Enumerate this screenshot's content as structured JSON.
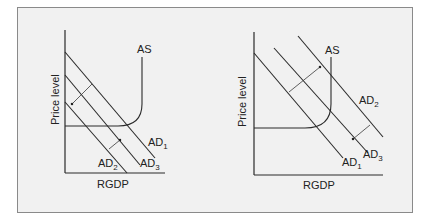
{
  "figure": {
    "panels": [
      {
        "id": "left",
        "y_label": "Price level",
        "x_label": "RGDP",
        "curves": {
          "as": "AS",
          "ad1": {
            "base": "AD",
            "sub": "1"
          },
          "ad2": {
            "base": "AD",
            "sub": "2"
          },
          "ad3": {
            "base": "AD",
            "sub": "3"
          }
        },
        "shifts": [
          "AD1 → AD2 (leftward)",
          "AD2 → AD3 (rightward)"
        ]
      },
      {
        "id": "right",
        "y_label": "Price level",
        "x_label": "RGDP",
        "curves": {
          "as": "AS",
          "ad1": {
            "base": "AD",
            "sub": "1"
          },
          "ad2": {
            "base": "AD",
            "sub": "2"
          },
          "ad3": {
            "base": "AD",
            "sub": "3"
          }
        },
        "shifts": [
          "AD1 → AD2 (rightward)",
          "AD2 → AD3 (leftward)"
        ]
      }
    ]
  },
  "colors": {
    "background": "#f1f1f1",
    "border": "#8a8a8a",
    "lines": "#2a2a2a"
  }
}
